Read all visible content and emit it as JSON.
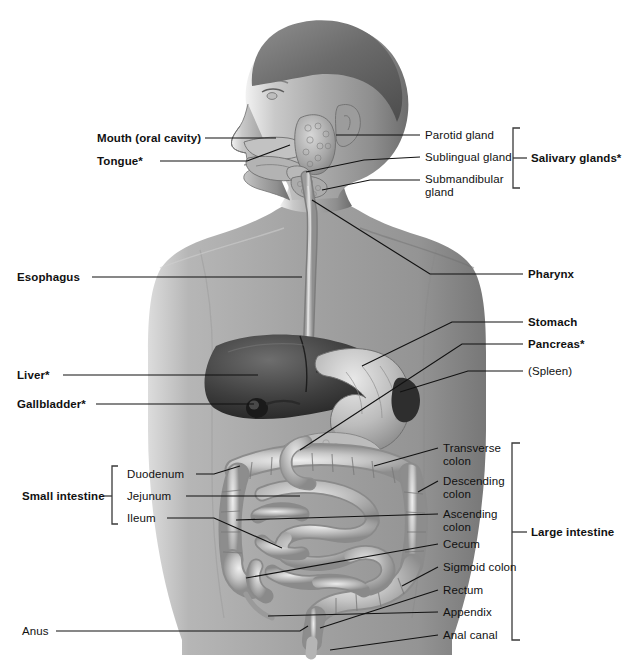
{
  "diagram": {
    "figure_description": "Grayscale anterior view of a human head in left profile and torso with digestive organs illustrated",
    "background_color": "#ffffff",
    "line_color": "#111111",
    "bracket_color": "#3a3a3a"
  },
  "labels_left": [
    {
      "id": "mouth",
      "text": "Mouth (oral cavity)",
      "bold": true,
      "x": 97,
      "y": 132
    },
    {
      "id": "tongue",
      "text": "Tongue*",
      "bold": true,
      "x": 97,
      "y": 155
    },
    {
      "id": "esophagus",
      "text": "Esophagus",
      "bold": true,
      "x": 17,
      "y": 275
    },
    {
      "id": "liver",
      "text": "Liver*",
      "bold": true,
      "x": 17,
      "y": 372
    },
    {
      "id": "gallbladder",
      "text": "Gallbladder*",
      "bold": true,
      "x": 17,
      "y": 401
    },
    {
      "id": "anus",
      "text": "Anus",
      "bold": false,
      "x": 22,
      "y": 629
    }
  ],
  "small_intestine_group": {
    "group_label": {
      "id": "small-intestine",
      "text": "Small intestine",
      "bold": true,
      "x": 22,
      "y": 493
    },
    "items": [
      {
        "id": "duodenum",
        "text": "Duodenum",
        "bold": false,
        "x": 127,
        "y": 471
      },
      {
        "id": "jejunum",
        "text": "Jejunum",
        "bold": false,
        "x": 127,
        "y": 493
      },
      {
        "id": "ileum",
        "text": "Ileum",
        "bold": false,
        "x": 127,
        "y": 515
      }
    ]
  },
  "salivary_group": {
    "group_label": {
      "id": "salivary-glands",
      "text": "Salivary glands*",
      "bold": true,
      "x": 531,
      "y": 155
    },
    "items": [
      {
        "id": "parotid-gland",
        "text": "Parotid gland",
        "bold": false,
        "x": 425,
        "y": 132
      },
      {
        "id": "sublingual-gland",
        "text": "Sublingual gland",
        "bold": false,
        "x": 425,
        "y": 154
      },
      {
        "id": "submandibular-gland",
        "text": "Submandibular\ngland",
        "bold": false,
        "x": 425,
        "y": 171
      }
    ]
  },
  "labels_right": [
    {
      "id": "pharynx",
      "text": "Pharynx",
      "bold": true,
      "x": 528,
      "y": 271
    },
    {
      "id": "stomach",
      "text": "Stomach",
      "bold": true,
      "x": 528,
      "y": 319
    },
    {
      "id": "pancreas",
      "text": "Pancreas*",
      "bold": true,
      "x": 528,
      "y": 341
    },
    {
      "id": "spleen",
      "text": "(Spleen)",
      "bold": false,
      "x": 528,
      "y": 368
    }
  ],
  "large_intestine_group": {
    "group_label": {
      "id": "large-intestine",
      "text": "Large intestine",
      "bold": true,
      "x": 531,
      "y": 529
    },
    "items": [
      {
        "id": "transverse-colon",
        "text": "Transverse\ncolon",
        "bold": false,
        "x": 443,
        "y": 442
      },
      {
        "id": "descending-colon",
        "text": "Descending\ncolon",
        "bold": false,
        "x": 443,
        "y": 475
      },
      {
        "id": "ascending-colon",
        "text": "Ascending\ncolon",
        "bold": false,
        "x": 443,
        "y": 508
      },
      {
        "id": "cecum",
        "text": "Cecum",
        "bold": false,
        "x": 443,
        "y": 541
      },
      {
        "id": "sigmoid-colon",
        "text": "Sigmoid colon",
        "bold": false,
        "x": 443,
        "y": 564
      },
      {
        "id": "rectum",
        "text": "Rectum",
        "bold": false,
        "x": 443,
        "y": 587
      },
      {
        "id": "appendix",
        "text": "Appendix",
        "bold": false,
        "x": 443,
        "y": 609
      },
      {
        "id": "anal-canal",
        "text": "Anal canal",
        "bold": false,
        "x": 443,
        "y": 632
      }
    ]
  }
}
